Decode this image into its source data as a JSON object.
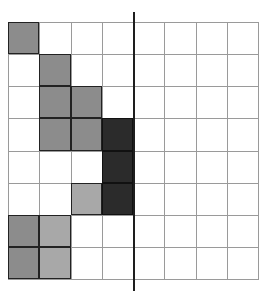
{
  "grid": {
    "rows": 8,
    "cols": 8,
    "colors": {
      "medium": "#8c8c8c",
      "light": "#a8a8a8",
      "dark": "#2b2b2b",
      "empty": "#ffffff",
      "line": "#9a9a9a"
    },
    "cells": [
      [
        "medium",
        "empty",
        "empty",
        "empty",
        "empty",
        "empty",
        "empty",
        "empty"
      ],
      [
        "empty",
        "medium",
        "empty",
        "empty",
        "empty",
        "empty",
        "empty",
        "empty"
      ],
      [
        "empty",
        "medium",
        "medium",
        "empty",
        "empty",
        "empty",
        "empty",
        "empty"
      ],
      [
        "empty",
        "medium",
        "medium",
        "dark",
        "empty",
        "empty",
        "empty",
        "empty"
      ],
      [
        "empty",
        "empty",
        "empty",
        "dark",
        "empty",
        "empty",
        "empty",
        "empty"
      ],
      [
        "empty",
        "empty",
        "light",
        "dark",
        "empty",
        "empty",
        "empty",
        "empty"
      ],
      [
        "medium",
        "light",
        "empty",
        "empty",
        "empty",
        "empty",
        "empty",
        "empty"
      ],
      [
        "medium",
        "light",
        "empty",
        "empty",
        "empty",
        "empty",
        "empty",
        "empty"
      ]
    ]
  },
  "divider": {
    "after_column": 4,
    "color": "#1e1e1e"
  }
}
